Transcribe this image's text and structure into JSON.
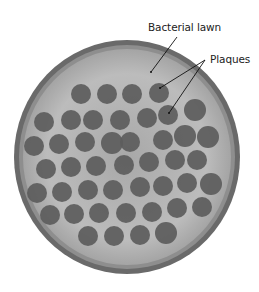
{
  "figure": {
    "labels": {
      "lawn": "Bacterial lawn",
      "plaques": "Plaques"
    },
    "colors": {
      "background": "#ffffff",
      "plate_rim": "#5a5a5a",
      "plate_inner_rim": "#8a8a8a",
      "lawn": "#b9b9b9",
      "plaque": "#5c5c5c",
      "label_text": "#222222",
      "leader_line": "#111111"
    },
    "plate": {
      "cx": 127,
      "cy": 157,
      "rx": 113,
      "ry": 117
    },
    "plaques": [
      {
        "x": 81,
        "y": 94,
        "r": 10
      },
      {
        "x": 107,
        "y": 94,
        "r": 10
      },
      {
        "x": 132,
        "y": 94,
        "r": 10
      },
      {
        "x": 159,
        "y": 93,
        "r": 10
      },
      {
        "x": 44,
        "y": 122,
        "r": 10
      },
      {
        "x": 71,
        "y": 120,
        "r": 10
      },
      {
        "x": 93,
        "y": 120,
        "r": 10
      },
      {
        "x": 120,
        "y": 120,
        "r": 10
      },
      {
        "x": 147,
        "y": 118,
        "r": 10
      },
      {
        "x": 168,
        "y": 115,
        "r": 10
      },
      {
        "x": 195,
        "y": 110,
        "r": 11
      },
      {
        "x": 34,
        "y": 146,
        "r": 10
      },
      {
        "x": 59,
        "y": 144,
        "r": 10
      },
      {
        "x": 85,
        "y": 142,
        "r": 10
      },
      {
        "x": 112,
        "y": 143,
        "r": 11
      },
      {
        "x": 130,
        "y": 142,
        "r": 10
      },
      {
        "x": 163,
        "y": 140,
        "r": 10
      },
      {
        "x": 185,
        "y": 136,
        "r": 11
      },
      {
        "x": 208,
        "y": 137,
        "r": 11
      },
      {
        "x": 46,
        "y": 169,
        "r": 10
      },
      {
        "x": 71,
        "y": 167,
        "r": 10
      },
      {
        "x": 96,
        "y": 166,
        "r": 10
      },
      {
        "x": 124,
        "y": 165,
        "r": 10
      },
      {
        "x": 149,
        "y": 162,
        "r": 10
      },
      {
        "x": 175,
        "y": 160,
        "r": 10
      },
      {
        "x": 197,
        "y": 160,
        "r": 10
      },
      {
        "x": 37,
        "y": 193,
        "r": 10
      },
      {
        "x": 62,
        "y": 192,
        "r": 10
      },
      {
        "x": 88,
        "y": 190,
        "r": 10
      },
      {
        "x": 113,
        "y": 190,
        "r": 10
      },
      {
        "x": 140,
        "y": 187,
        "r": 10
      },
      {
        "x": 163,
        "y": 186,
        "r": 10
      },
      {
        "x": 187,
        "y": 183,
        "r": 10
      },
      {
        "x": 211,
        "y": 184,
        "r": 11
      },
      {
        "x": 50,
        "y": 215,
        "r": 10
      },
      {
        "x": 74,
        "y": 214,
        "r": 10
      },
      {
        "x": 99,
        "y": 213,
        "r": 10
      },
      {
        "x": 126,
        "y": 213,
        "r": 10
      },
      {
        "x": 152,
        "y": 212,
        "r": 10
      },
      {
        "x": 177,
        "y": 208,
        "r": 10
      },
      {
        "x": 202,
        "y": 207,
        "r": 10
      },
      {
        "x": 88,
        "y": 236,
        "r": 10
      },
      {
        "x": 114,
        "y": 236,
        "r": 10
      },
      {
        "x": 140,
        "y": 235,
        "r": 10
      },
      {
        "x": 166,
        "y": 233,
        "r": 11
      }
    ]
  }
}
